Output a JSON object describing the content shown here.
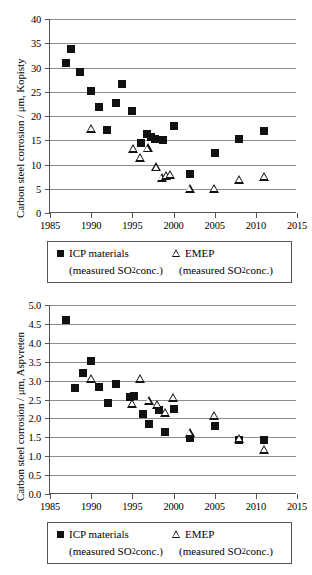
{
  "legend": {
    "icp_marker": "filled-square",
    "icp_label": "ICP materials",
    "icp_sub_pre": "(measured SO",
    "icp_sub_idx": "2",
    "icp_sub_post": " conc.)",
    "emep_marker": "open-triangle",
    "emep_label": "EMEP",
    "emep_sub_pre": "(measured SO",
    "emep_sub_idx": "2",
    "emep_sub_post": " conc.)"
  },
  "chart_data": [
    {
      "type": "scatter",
      "title": "",
      "xlabel": "",
      "ylabel": "Carbon steel corrosion / μm, Kopisty",
      "xlim": [
        1985,
        2015
      ],
      "ylim": [
        0,
        40
      ],
      "xticks": [
        1985,
        1990,
        1995,
        2000,
        2005,
        2010,
        2015
      ],
      "xticklabels": [
        "1985",
        "1990",
        "1995",
        "2000",
        "2005",
        "2010",
        "2015"
      ],
      "yticks": [
        0,
        5,
        10,
        15,
        20,
        25,
        30,
        35,
        40
      ],
      "yticklabels": [
        "0",
        "5",
        "10",
        "15",
        "20",
        "25",
        "30",
        "35",
        "40"
      ],
      "grid": true,
      "legend_position": "below",
      "series": [
        {
          "name": "ICP materials (measured SO2 conc.)",
          "marker": "filled-square",
          "points": [
            {
              "x": 1986.9,
              "y": 31.0
            },
            {
              "x": 1987.6,
              "y": 33.9
            },
            {
              "x": 1988.7,
              "y": 29.0
            },
            {
              "x": 1990.0,
              "y": 25.2
            },
            {
              "x": 1991.0,
              "y": 21.8
            },
            {
              "x": 1991.9,
              "y": 17.2
            },
            {
              "x": 1993.0,
              "y": 22.6
            },
            {
              "x": 1993.7,
              "y": 26.5
            },
            {
              "x": 1995.0,
              "y": 21.1
            },
            {
              "x": 1996.0,
              "y": 14.5
            },
            {
              "x": 1996.8,
              "y": 16.2
            },
            {
              "x": 1997.3,
              "y": 15.6
            },
            {
              "x": 1997.8,
              "y": 15.2
            },
            {
              "x": 1998.7,
              "y": 15.0
            },
            {
              "x": 2000.0,
              "y": 17.9
            },
            {
              "x": 2002.0,
              "y": 8.0
            },
            {
              "x": 2005.0,
              "y": 12.4
            },
            {
              "x": 2008.0,
              "y": 15.2
            },
            {
              "x": 2011.0,
              "y": 17.0
            }
          ]
        },
        {
          "name": "EMEP (measured SO2 conc.)",
          "marker": "open-triangle",
          "points": [
            {
              "x": 1990.0,
              "y": 17.4
            },
            {
              "x": 1995.1,
              "y": 13.2
            },
            {
              "x": 1996.0,
              "y": 11.3
            },
            {
              "x": 1996.9,
              "y": 13.3
            },
            {
              "x": 1997.9,
              "y": 9.4
            },
            {
              "x": 1998.6,
              "y": 7.3
            },
            {
              "x": 1999.1,
              "y": 7.6
            },
            {
              "x": 1999.6,
              "y": 7.8
            },
            {
              "x": 2002.0,
              "y": 5.0
            },
            {
              "x": 2005.0,
              "y": 5.0
            },
            {
              "x": 2008.0,
              "y": 6.9
            },
            {
              "x": 2011.0,
              "y": 7.4
            }
          ]
        }
      ]
    },
    {
      "type": "scatter",
      "title": "",
      "xlabel": "",
      "ylabel": "Carbon steel corrosion / μm, Aspvreten",
      "xlim": [
        1985,
        2015
      ],
      "ylim": [
        0.0,
        5.0
      ],
      "xticks": [
        1985,
        1990,
        1995,
        2000,
        2005,
        2010,
        2015
      ],
      "xticklabels": [
        "1985",
        "1990",
        "1995",
        "2000",
        "2005",
        "2010",
        "2015"
      ],
      "yticks": [
        0.0,
        0.5,
        1.0,
        1.5,
        2.0,
        2.5,
        3.0,
        3.5,
        4.0,
        4.5,
        5.0
      ],
      "yticklabels": [
        "0.0",
        "0.5",
        "1.0",
        "1.5",
        "2.0",
        "2.5",
        "3.0",
        "3.5",
        "4.0",
        "4.5",
        "5.0"
      ],
      "grid": true,
      "legend_position": "below",
      "series": [
        {
          "name": "ICP materials (measured SO2 conc.)",
          "marker": "filled-square",
          "points": [
            {
              "x": 1987.0,
              "y": 4.6
            },
            {
              "x": 1988.0,
              "y": 2.8
            },
            {
              "x": 1989.0,
              "y": 3.21
            },
            {
              "x": 1990.0,
              "y": 3.52
            },
            {
              "x": 1991.0,
              "y": 2.84
            },
            {
              "x": 1992.0,
              "y": 2.41
            },
            {
              "x": 1993.0,
              "y": 2.9
            },
            {
              "x": 1994.7,
              "y": 2.57
            },
            {
              "x": 1995.2,
              "y": 2.59
            },
            {
              "x": 1996.3,
              "y": 2.12
            },
            {
              "x": 1997.0,
              "y": 1.84
            },
            {
              "x": 1998.2,
              "y": 2.22
            },
            {
              "x": 1999.0,
              "y": 1.65
            },
            {
              "x": 2000.0,
              "y": 2.25
            },
            {
              "x": 2002.0,
              "y": 1.47
            },
            {
              "x": 2005.0,
              "y": 1.81
            },
            {
              "x": 2008.0,
              "y": 1.44
            },
            {
              "x": 2011.0,
              "y": 1.42
            }
          ]
        },
        {
          "name": "EMEP (measured SO2 conc.)",
          "marker": "open-triangle",
          "points": [
            {
              "x": 1990.0,
              "y": 3.04
            },
            {
              "x": 1995.0,
              "y": 2.39
            },
            {
              "x": 1996.0,
              "y": 3.04
            },
            {
              "x": 1997.0,
              "y": 2.47
            },
            {
              "x": 1998.0,
              "y": 2.36
            },
            {
              "x": 1999.0,
              "y": 2.15
            },
            {
              "x": 2000.0,
              "y": 2.54
            },
            {
              "x": 2002.0,
              "y": 1.62
            },
            {
              "x": 2005.0,
              "y": 2.07
            },
            {
              "x": 2008.0,
              "y": 1.46
            },
            {
              "x": 2011.0,
              "y": 1.17
            }
          ]
        }
      ]
    }
  ]
}
